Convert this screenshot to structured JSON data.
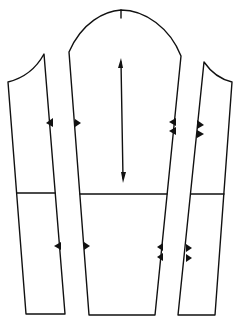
{
  "diagram": {
    "type": "sewing-pattern",
    "stroke_color": "#111111",
    "background": "#ffffff",
    "pieces": [
      {
        "name": "left-underarm-panel",
        "notches": 2
      },
      {
        "name": "center-sleeve-panel",
        "notches": 6,
        "grainline": true,
        "top_center_mark": true
      },
      {
        "name": "right-underarm-panel",
        "notches": 4
      }
    ],
    "horizontal_cut_line": true
  }
}
